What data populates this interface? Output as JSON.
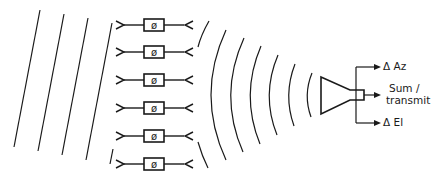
{
  "diagram": {
    "type": "phased-array-reflectarray-feed",
    "incident_wavefront": {
      "kind": "plane-wave",
      "line_count": 4
    },
    "array_elements": {
      "count": 6,
      "phase_shifter_symbol": "ø",
      "rows_y": [
        25,
        52,
        80,
        108,
        136,
        164
      ]
    },
    "reradiated_wavefront": {
      "kind": "spherical-wave",
      "arc_count": 8
    },
    "feed": {
      "kind": "horn",
      "outputs": [
        {
          "id": "delta_az",
          "label": "Δ Az"
        },
        {
          "id": "sum_transmit",
          "label_line1": "Sum  /",
          "label_line2": "transmit"
        },
        {
          "id": "delta_el",
          "label": "Δ El"
        }
      ]
    },
    "colors": {
      "line": "#1a1a1a",
      "background": "#ffffff"
    }
  }
}
